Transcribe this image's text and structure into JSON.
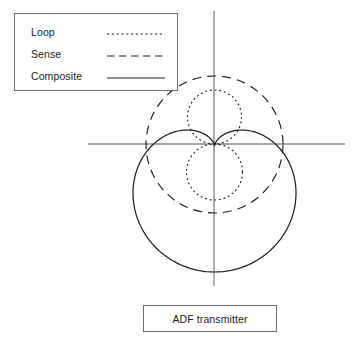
{
  "figure": {
    "background": "#ffffff"
  },
  "legend": {
    "box_border_color": "#6b6b6b",
    "position": "top-left",
    "items": [
      {
        "label": "Loop",
        "style": "dotted",
        "color": "#1c1c1c"
      },
      {
        "label": "Sense",
        "style": "dashed",
        "color": "#1c1c1c"
      },
      {
        "label": "Composite",
        "style": "solid",
        "color": "#1c1c1c"
      }
    ]
  },
  "axes": {
    "color": "#8a8a8a",
    "origin": {
      "x": 214,
      "y": 144
    },
    "horizontal": {
      "x1": 88,
      "x2": 345,
      "y": 144
    },
    "vertical": {
      "y1": 11,
      "y2": 286,
      "x": 214
    }
  },
  "caption": {
    "text": "ADF transmitter",
    "box_border_color": "#6b6b6b"
  },
  "chart_data": {
    "type": "line",
    "title": "ADF transmitter",
    "xlabel": "",
    "ylabel": "",
    "coordinate_system": "polar",
    "grid": false,
    "legend_position": "top-left",
    "annotations": [
      "ADF transmitter"
    ],
    "origin_px": {
      "x": 214,
      "y": 144
    },
    "series": [
      {
        "name": "Loop",
        "style": "dotted",
        "color": "#1c1c1c",
        "pattern": "figure-eight",
        "polar_equation": "r = a * |cos(theta)|",
        "a": 55,
        "lobes": [
          {
            "orientation": "up",
            "center_px": {
              "x": 214,
              "y": 117
            },
            "radius_px": 27,
            "extent_px": {
              "top": 90,
              "bottom": 144
            }
          },
          {
            "orientation": "down",
            "center_px": {
              "x": 214,
              "y": 172
            },
            "radius_px": 28,
            "extent_px": {
              "top": 144,
              "bottom": 200
            }
          }
        ]
      },
      {
        "name": "Sense",
        "style": "dashed",
        "color": "#1c1c1c",
        "pattern": "omnidirectional-circle",
        "polar_equation": "r = a",
        "a": 55,
        "center_px": {
          "x": 214,
          "y": 145
        },
        "radius_px": 68,
        "extent_px": {
          "left": 146,
          "right": 283,
          "top": 89,
          "bottom": 200
        }
      },
      {
        "name": "Composite",
        "style": "solid",
        "color": "#1c1c1c",
        "pattern": "cardioid",
        "polar_equation": "r = a * (1 + sin(theta))",
        "a": 64,
        "cusp_px": {
          "x": 214,
          "y": 144
        },
        "orientation": "cusp-up",
        "extent_px": {
          "left": 133,
          "right": 296,
          "top": 130,
          "bottom": 272
        }
      }
    ]
  }
}
